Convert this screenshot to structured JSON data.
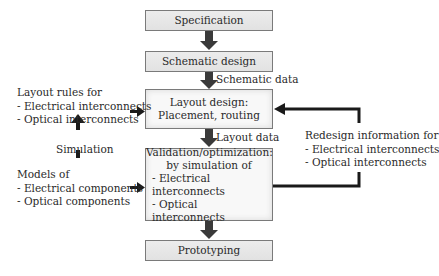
{
  "diagram": {
    "boxes": {
      "specification": "Specification",
      "schematic_design": "Schematic design",
      "layout_design": [
        "Layout design:",
        "Placement, routing"
      ],
      "validation": [
        "Validation/optimization:",
        "by simulation of",
        "- Electrical interconnects",
        "- Optical interconnects"
      ],
      "prototyping": "Prototyping"
    },
    "edge_labels": {
      "schematic_data": "Schematic data",
      "layout_data": "Layout data",
      "simulation": "Simulation"
    },
    "side_notes": {
      "layout_rules": [
        "Layout rules for",
        "- Electrical interconnects",
        "- Optical interconnects"
      ],
      "models": [
        "Models of",
        "- Electrical components",
        "- Optical components"
      ],
      "redesign": [
        "Redesign information for",
        "- Electrical interconnects",
        "- Optical interconnects"
      ]
    },
    "colors": {
      "box_fill": "#e6e6e6",
      "box_border": "#7a7a7a",
      "arrow": "#1a1a1a",
      "flow_arrow": "#3a3a3a"
    }
  }
}
